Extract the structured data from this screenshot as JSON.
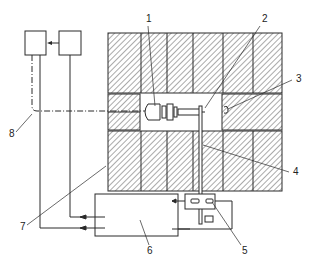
{
  "diagram": {
    "type": "schematic",
    "labels": [
      {
        "id": "1",
        "text": "1",
        "x": 146,
        "y": 22
      },
      {
        "id": "2",
        "text": "2",
        "x": 262,
        "y": 22
      },
      {
        "id": "3",
        "text": "3",
        "x": 296,
        "y": 82
      },
      {
        "id": "4",
        "text": "4",
        "x": 293,
        "y": 175
      },
      {
        "id": "5",
        "text": "5",
        "x": 242,
        "y": 254
      },
      {
        "id": "6",
        "text": "6",
        "x": 147,
        "y": 254
      },
      {
        "id": "7",
        "text": "7",
        "x": 20,
        "y": 230
      },
      {
        "id": "8",
        "text": "8",
        "x": 9,
        "y": 137
      }
    ],
    "colors": {
      "line": "#2a2a2a",
      "hatch": "#555555",
      "background": "#ffffff"
    }
  }
}
